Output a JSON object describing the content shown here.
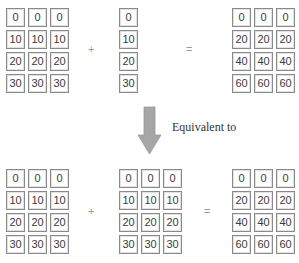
{
  "top": {
    "matrix_a": [
      [
        "0",
        "0",
        "0"
      ],
      [
        "10",
        "10",
        "10"
      ],
      [
        "20",
        "20",
        "20"
      ],
      [
        "30",
        "30",
        "30"
      ]
    ],
    "operator_plus": "+",
    "vector_b": [
      [
        "0"
      ],
      [
        "10"
      ],
      [
        "20"
      ],
      [
        "30"
      ]
    ],
    "operator_equals": "=",
    "result": [
      [
        "0",
        "0",
        "0"
      ],
      [
        "20",
        "20",
        "20"
      ],
      [
        "40",
        "40",
        "40"
      ],
      [
        "60",
        "60",
        "60"
      ]
    ]
  },
  "arrow": {
    "label": "Equivalent to",
    "color": "#a6a6a6",
    "icon": "down-arrow-icon"
  },
  "bottom": {
    "matrix_a": [
      [
        "0",
        "0",
        "0"
      ],
      [
        "10",
        "10",
        "10"
      ],
      [
        "20",
        "20",
        "20"
      ],
      [
        "30",
        "30",
        "30"
      ]
    ],
    "operator_plus": "+",
    "matrix_b_broadcast": [
      [
        "0",
        "0",
        "0"
      ],
      [
        "10",
        "10",
        "10"
      ],
      [
        "20",
        "20",
        "20"
      ],
      [
        "30",
        "30",
        "30"
      ]
    ],
    "operator_equals": "=",
    "result": [
      [
        "0",
        "0",
        "0"
      ],
      [
        "20",
        "20",
        "20"
      ],
      [
        "40",
        "40",
        "40"
      ],
      [
        "60",
        "60",
        "60"
      ]
    ]
  }
}
